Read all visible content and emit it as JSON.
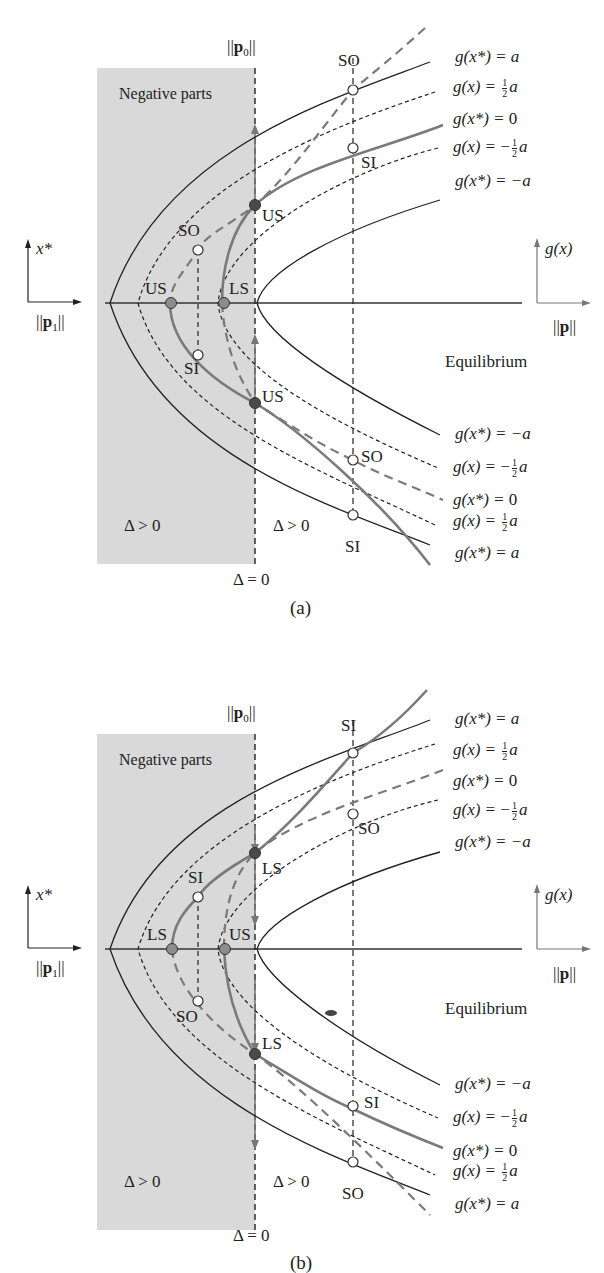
{
  "figure": {
    "panels": [
      {
        "id": "a",
        "caption": "(a)",
        "region_label": "Negative parts",
        "axis_top_label": "||p0||",
        "axis_left_label": "||p1||",
        "axis_left_arrow_label": "x*",
        "axis_right_label": "||p||",
        "axis_right_arrow_label": "g(x)",
        "equilibrium_label": "Equilibrium",
        "delta_left": "Δ > 0",
        "delta_right": "Δ > 0",
        "delta_zero": "Δ = 0",
        "curve_labels_top": [
          "g(x*) = a",
          "g(x) = ½a",
          "g(x*) = 0",
          "g(x) = −½a",
          "g(x*) = −a"
        ],
        "curve_labels_bottom": [
          "g(x*) = −a",
          "g(x) = −½a",
          "g(x*) = 0",
          "g(x) = ½a",
          "g(x*) = a"
        ],
        "points": [
          {
            "label": "SO",
            "type": "open",
            "position": "top-right"
          },
          {
            "label": "SI",
            "type": "open",
            "position": "upper-middle-right"
          },
          {
            "label": "US",
            "type": "dark",
            "position": "upper-delta0"
          },
          {
            "label": "SO",
            "type": "open",
            "position": "left-upper"
          },
          {
            "label": "US",
            "type": "gray",
            "position": "left-axis"
          },
          {
            "label": "LS",
            "type": "gray",
            "position": "inner-axis"
          },
          {
            "label": "SI",
            "type": "open",
            "position": "left-lower"
          },
          {
            "label": "US",
            "type": "dark",
            "position": "lower-delta0"
          },
          {
            "label": "SO",
            "type": "open",
            "position": "lower-middle-right"
          },
          {
            "label": "SI",
            "type": "open",
            "position": "bottom-right"
          }
        ]
      },
      {
        "id": "b",
        "caption": "(b)",
        "region_label": "Negative parts",
        "axis_top_label": "||p0||",
        "axis_left_label": "||p1||",
        "axis_left_arrow_label": "x*",
        "axis_right_label": "||p||",
        "axis_right_arrow_label": "g(x)",
        "equilibrium_label": "Equilibrium",
        "delta_left": "Δ > 0",
        "delta_right": "Δ > 0",
        "delta_zero": "Δ = 0",
        "curve_labels_top": [
          "g(x*) = a",
          "g(x) = ½a",
          "g(x*) = 0",
          "g(x) = −½a",
          "g(x*) = −a"
        ],
        "curve_labels_bottom": [
          "g(x*) = −a",
          "g(x) = −½a",
          "g(x*) = 0",
          "g(x) = ½a",
          "g(x*) = a"
        ],
        "points": [
          {
            "label": "SI",
            "type": "open",
            "position": "top-right"
          },
          {
            "label": "SO",
            "type": "open",
            "position": "upper-middle-right"
          },
          {
            "label": "LS",
            "type": "dark",
            "position": "upper-delta0"
          },
          {
            "label": "SI",
            "type": "open",
            "position": "left-upper"
          },
          {
            "label": "LS",
            "type": "gray",
            "position": "left-axis"
          },
          {
            "label": "US",
            "type": "gray",
            "position": "inner-axis"
          },
          {
            "label": "SO",
            "type": "open",
            "position": "left-lower"
          },
          {
            "label": "LS",
            "type": "dark",
            "position": "lower-delta0"
          },
          {
            "label": "SI",
            "type": "open",
            "position": "lower-middle-right"
          },
          {
            "label": "SO",
            "type": "open",
            "position": "bottom-right"
          }
        ]
      }
    ]
  },
  "colors": {
    "shade": "#d9d9d9",
    "line": "#222222",
    "gray_curve": "#7a7a7a",
    "dark_point": "#4a4a4a",
    "gray_point": "#8c8c8c"
  },
  "text": {
    "a": {
      "negative": "Negative parts",
      "p0_pre": "||",
      "p0_bold": "p",
      "p0_sub": "0",
      "p0_post": "||",
      "p1_pre": "||",
      "p1_bold": "p",
      "p1_sub": "1",
      "p1_post": "||",
      "p_pre": "||",
      "p_bold": "p",
      "p_post": "||",
      "xstar": "x*",
      "gx": "g(x)",
      "equilibrium": "Equilibrium",
      "delta_left": "Δ > 0",
      "delta_right": "Δ > 0",
      "delta_zero": "Δ = 0",
      "caption": "(a)",
      "pt_SO_top": "SO",
      "pt_SI_mid": "SI",
      "pt_US_up": "US",
      "pt_SO_left": "SO",
      "pt_US_axis": "US",
      "pt_LS_axis": "LS",
      "pt_SI_left": "SI",
      "pt_US_low": "US",
      "pt_SO_low": "SO",
      "pt_SI_bot": "SI",
      "eq_g_star": "g(x*) = ",
      "eq_g": "g(x) = ",
      "eq_a": "a",
      "eq_neg_a": "−a",
      "eq_zero": "0",
      "eq_neg": "−",
      "half_num": "1",
      "half_den": "2"
    },
    "b": {
      "negative": "Negative parts",
      "xstar": "x*",
      "gx": "g(x)",
      "equilibrium": "Equilibrium",
      "delta_left": "Δ > 0",
      "delta_right": "Δ > 0",
      "delta_zero": "Δ = 0",
      "caption": "(b)",
      "pt_SI_top": "SI",
      "pt_SO_mid": "SO",
      "pt_LS_up": "LS",
      "pt_SI_left": "SI",
      "pt_LS_axis": "LS",
      "pt_US_axis": "US",
      "pt_SO_left": "SO",
      "pt_LS_low": "LS",
      "pt_SI_low": "SI",
      "pt_SO_bot": "SO"
    }
  }
}
